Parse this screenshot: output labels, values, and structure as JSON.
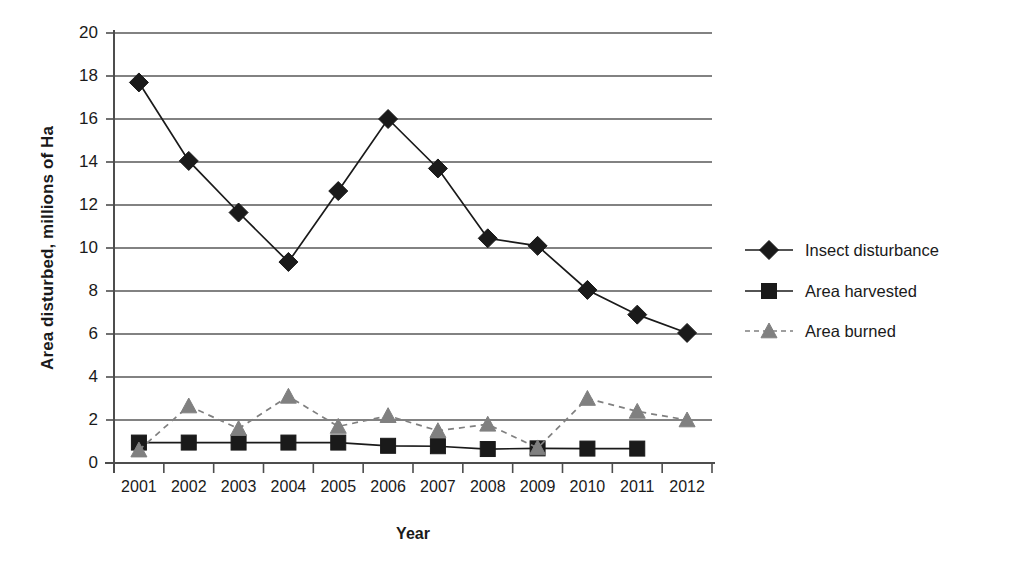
{
  "chart_data": {
    "type": "line",
    "title": "",
    "xlabel": "Year",
    "ylabel": "Area disturbed, millions of Ha",
    "categories": [
      "2001",
      "2002",
      "2003",
      "2004",
      "2005",
      "2006",
      "2007",
      "2008",
      "2009",
      "2010",
      "2011",
      "2012"
    ],
    "ylim": [
      0,
      20
    ],
    "yticks": [
      0,
      2,
      4,
      6,
      8,
      10,
      12,
      14,
      16,
      18,
      20
    ],
    "ytick_labels": [
      "0",
      "2",
      "4",
      "6",
      "8",
      "10",
      "12",
      "14",
      "16",
      "18",
      "20"
    ],
    "grid": "horizontal",
    "legend_position": "right",
    "series": [
      {
        "name": "Insect disturbance",
        "marker": "diamond",
        "line": "solid",
        "color": "#1a1a1a",
        "values": [
          17.7,
          14.05,
          11.65,
          9.35,
          12.65,
          16.0,
          13.7,
          10.45,
          10.1,
          8.05,
          6.9,
          6.05
        ]
      },
      {
        "name": "Area harvested",
        "marker": "square",
        "line": "solid",
        "color": "#1a1a1a",
        "values": [
          0.95,
          0.95,
          0.95,
          0.95,
          0.95,
          0.8,
          0.78,
          0.65,
          0.68,
          0.67,
          0.67,
          null
        ]
      },
      {
        "name": "Area burned",
        "marker": "triangle",
        "line": "dashed",
        "color": "#808080",
        "values": [
          0.6,
          2.65,
          1.6,
          3.1,
          1.7,
          2.2,
          1.5,
          1.8,
          0.7,
          3.0,
          2.4,
          2.0
        ]
      }
    ]
  },
  "axes": {
    "y_title": "Area disturbed, millions of Ha",
    "x_title": "Year"
  },
  "legend": {
    "items": [
      {
        "label": "Insect disturbance"
      },
      {
        "label": "Area harvested"
      },
      {
        "label": "Area burned"
      }
    ]
  },
  "colors": {
    "axis": "#4d4d4d",
    "grid": "#595959",
    "series_dark": "#1a1a1a",
    "series_gray": "#808080",
    "background": "#ffffff"
  }
}
